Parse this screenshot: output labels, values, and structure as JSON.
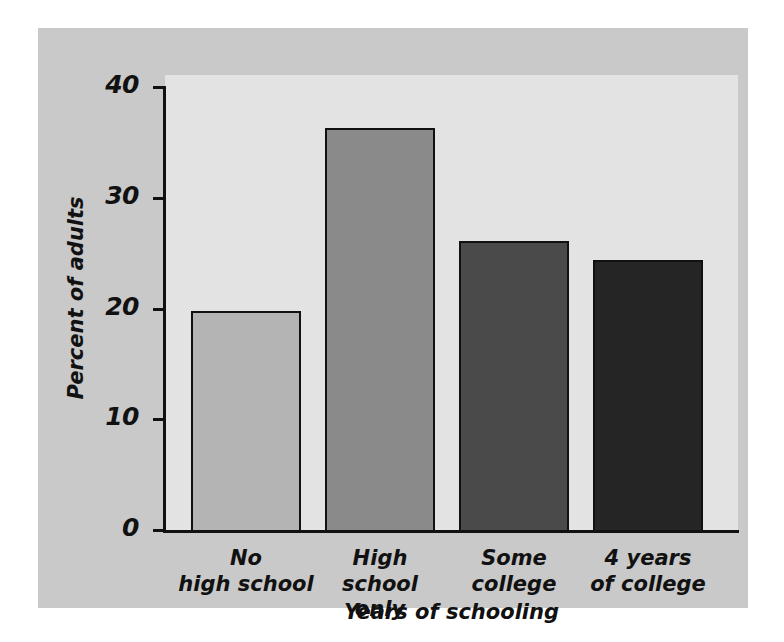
{
  "chart_data": {
    "type": "bar",
    "title": "",
    "xlabel": "Years of schooling",
    "ylabel": "Percent of adults",
    "categories": [
      "No high school",
      "High school only",
      "Some college",
      "4 years of college"
    ],
    "category_lines": [
      [
        "No",
        "high school"
      ],
      [
        "High school",
        "only"
      ],
      [
        "Some",
        "college"
      ],
      [
        "4 years",
        "of college"
      ]
    ],
    "values": [
      19.8,
      36.3,
      26.1,
      24.4
    ],
    "bar_colors": [
      "#b4b4b4",
      "#8a8a8a",
      "#4a4a4a",
      "#252525"
    ],
    "ylim": [
      0,
      40
    ],
    "yticks": [
      0,
      10,
      20,
      30,
      40
    ],
    "ytick_labels": [
      "0",
      "10",
      "20",
      "30",
      "40"
    ],
    "grid": false,
    "legend": "none"
  },
  "figure": {
    "panel_color": "#c9c9c9",
    "plot_color": "#e3e3e3",
    "axis_color": "#111111",
    "background": "#ffffff"
  }
}
